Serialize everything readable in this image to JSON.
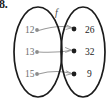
{
  "figure": {
    "exercise_number": "8.",
    "type": "mapping-diagram",
    "map_label": "f",
    "domain": {
      "name": "left-set",
      "elements": [
        "12",
        "13",
        "15"
      ]
    },
    "codomain": {
      "name": "right-set",
      "elements": [
        "26",
        "32",
        "9"
      ]
    },
    "arrows": [
      {
        "from": "12",
        "to": "26"
      },
      {
        "from": "13",
        "to": "32"
      },
      {
        "from": "15",
        "to": "9"
      }
    ],
    "colors": {
      "ellipse_stroke": "#1b1b1b",
      "arrow_stroke": "#9a9a9a",
      "left_label": "#6e6e6e",
      "right_label": "#232323",
      "left_dot": "#8d8d8d",
      "right_dot": "#1e1e1e",
      "background": "#ffffff"
    }
  }
}
